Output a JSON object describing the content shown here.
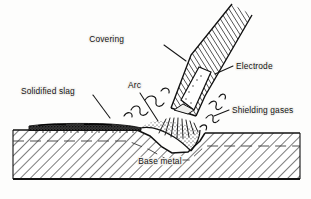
{
  "figure": {
    "type": "technical-illustration",
    "background_color": "#fdfdfc",
    "ink_color": "#121212"
  },
  "labels": {
    "covering": "Covering",
    "electrode": "Electrode",
    "solidified_slag": "Solidified slag",
    "arc": "Arc",
    "shielding_gases": "Shielding gases",
    "base_metal": "Base metal"
  },
  "parts": [
    {
      "name": "covering",
      "label": "Covering",
      "description": "Hatched flux coating around the electrode rod",
      "label_x": 124,
      "label_y": 42,
      "leader_from": [
        164,
        45
      ],
      "leader_to": [
        186,
        61
      ]
    },
    {
      "name": "electrode",
      "label": "Electrode",
      "description": "Consumable metal core rod held at an angle",
      "label_x": 236,
      "label_y": 68,
      "leader_from": [
        233,
        66
      ],
      "leader_to": [
        215,
        74
      ]
    },
    {
      "name": "solidified-slag",
      "label": "Solidified slag",
      "description": "Dark crust of frozen flux over the finished weld bead",
      "label_x": 22,
      "label_y": 92,
      "leader_from": [
        93,
        95
      ],
      "leader_to": [
        110,
        117
      ]
    },
    {
      "name": "arc",
      "label": "Arc",
      "description": "Electric arc between electrode tip and base metal",
      "label_x": 127,
      "label_y": 89,
      "leader_from": [
        140,
        93
      ],
      "leader_to": [
        157,
        120
      ]
    },
    {
      "name": "shielding-gases",
      "label": "Shielding gases",
      "description": "Gas cloud given off by the burning covering",
      "label_x": 232,
      "label_y": 113,
      "leader_from": [
        229,
        110
      ],
      "leader_to": [
        215,
        116
      ]
    },
    {
      "name": "base-metal",
      "label": "Base metal",
      "description": "Hatched parent plate being joined",
      "label_x": 160,
      "label_y": 164
    }
  ],
  "geometry": {
    "plate_left_x": 13,
    "plate_right_x": 300,
    "plate_bottom_y": 179,
    "left_surface_y": 130,
    "right_surface_y": 133,
    "electrode_angle_deg": 58
  }
}
